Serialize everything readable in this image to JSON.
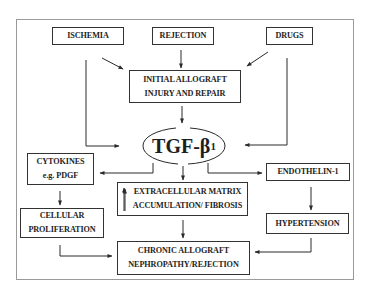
{
  "diagram": {
    "title_center": {
      "main": "TGF-β",
      "subscript": "1"
    },
    "nodes": {
      "ischemia": {
        "lines": [
          "ISCHEMIA"
        ]
      },
      "rejection": {
        "lines": [
          "REJECTION"
        ]
      },
      "drugs": {
        "lines": [
          "DRUGS"
        ]
      },
      "initial_injury": {
        "lines": [
          "INITIAL ALLOGRAFT",
          "INJURY AND REPAIR"
        ]
      },
      "cytokines": {
        "lines": [
          "CYTOKINES",
          "e.g. PDGF"
        ]
      },
      "ecm": {
        "lines": [
          "EXTRACELLULAR MATRIX",
          "ACCUMULATION/ FIBROSIS"
        ]
      },
      "endothelin": {
        "lines": [
          "ENDOTHELIN-1"
        ]
      },
      "proliferation": {
        "lines": [
          "CELLULAR",
          "PROLIFERATION"
        ]
      },
      "hypertension": {
        "lines": [
          "HYPERTENSION"
        ]
      },
      "chronic": {
        "lines": [
          "CHRONIC ALLOGRAFT",
          "NEPHROPATHY/REJECTION"
        ]
      }
    },
    "edges": [
      [
        "ISCHEMIA",
        "INITIAL ALLOGRAFT INJURY AND REPAIR"
      ],
      [
        "REJECTION",
        "INITIAL ALLOGRAFT INJURY AND REPAIR"
      ],
      [
        "DRUGS",
        "INITIAL ALLOGRAFT INJURY AND REPAIR"
      ],
      [
        "ISCHEMIA",
        "TGF-β1"
      ],
      [
        "DRUGS",
        "TGF-β1"
      ],
      [
        "INITIAL ALLOGRAFT INJURY AND REPAIR",
        "TGF-β1"
      ],
      [
        "TGF-β1",
        "CYTOKINES e.g. PDGF"
      ],
      [
        "TGF-β1",
        "EXTRACELLULAR MATRIX ACCUMULATION/ FIBROSIS"
      ],
      [
        "TGF-β1",
        "ENDOTHELIN-1"
      ],
      [
        "CYTOKINES e.g. PDGF",
        "CELLULAR PROLIFERATION"
      ],
      [
        "ENDOTHELIN-1",
        "HYPERTENSION"
      ],
      [
        "EXTRACELLULAR MATRIX ACCUMULATION/ FIBROSIS",
        "CHRONIC ALLOGRAFT NEPHROPATHY/REJECTION"
      ],
      [
        "CELLULAR PROLIFERATION",
        "CHRONIC ALLOGRAFT NEPHROPATHY/REJECTION"
      ],
      [
        "HYPERTENSION",
        "CHRONIC ALLOGRAFT NEPHROPATHY/REJECTION"
      ]
    ],
    "colors": {
      "line": "#2a2a2a",
      "frame": "#9a9a9a",
      "text": "#1e1e1e",
      "background": "#ffffff"
    }
  }
}
